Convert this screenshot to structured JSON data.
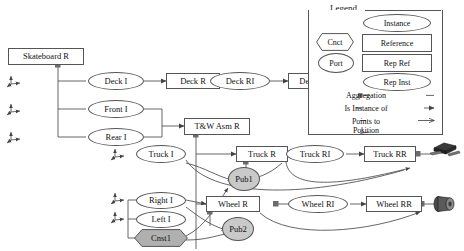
{
  "diagram": {
    "nodes": [
      {
        "id": "skateboard-r",
        "label": "Skateboard R",
        "shape": "rect",
        "x": 8,
        "y": 48,
        "w": 76,
        "h": 17
      },
      {
        "id": "deck-i",
        "label": "Deck I",
        "shape": "ellipse",
        "x": 88,
        "y": 72,
        "w": 56,
        "h": 18
      },
      {
        "id": "front-i",
        "label": "Front I",
        "shape": "ellipse",
        "x": 88,
        "y": 100,
        "w": 56,
        "h": 18
      },
      {
        "id": "rear-i",
        "label": "Rear I",
        "shape": "ellipse",
        "x": 88,
        "y": 128,
        "w": 56,
        "h": 18
      },
      {
        "id": "deck-r",
        "label": "Deck R",
        "shape": "rect",
        "x": 88,
        "y": 73,
        "w": 54,
        "h": 16
      },
      {
        "id": "deck-ri",
        "label": "Deck RI",
        "shape": "ellipse",
        "x": 150,
        "y": 72,
        "w": 60,
        "h": 18
      },
      {
        "id": "deck-rr",
        "label": "Deck RR",
        "shape": "rect",
        "x": 216,
        "y": 73,
        "w": 54,
        "h": 16
      },
      {
        "id": "tw-asm-r",
        "label": "T&W Asm R",
        "shape": "rect",
        "x": 86,
        "y": 118,
        "w": 66,
        "h": 17
      },
      {
        "id": "truck-i",
        "label": "Truck I",
        "shape": "ellipse",
        "x": 103,
        "y": 145,
        "w": 50,
        "h": 18
      },
      {
        "id": "truck-r",
        "label": "Truck R",
        "shape": "rect",
        "x": 168,
        "y": 146,
        "w": 52,
        "h": 16
      },
      {
        "id": "truck-ri",
        "label": "Truck RI",
        "shape": "ellipse",
        "x": 226,
        "y": 145,
        "w": 58,
        "h": 18
      },
      {
        "id": "truck-rr",
        "label": "Truck RR",
        "shape": "rect",
        "x": 294,
        "y": 146,
        "w": 52,
        "h": 16
      },
      {
        "id": "pub1",
        "label": "Pub1",
        "shape": "circle",
        "x": 185,
        "y": 168,
        "w": 32,
        "h": 24
      },
      {
        "id": "right-i",
        "label": "Right I",
        "shape": "ellipse",
        "x": 103,
        "y": 191,
        "w": 50,
        "h": 17
      },
      {
        "id": "left-i",
        "label": "Left I",
        "shape": "ellipse",
        "x": 103,
        "y": 210,
        "w": 50,
        "h": 17
      },
      {
        "id": "cnst1",
        "label": "Cnst1",
        "shape": "hexagon",
        "x": 101,
        "y": 229,
        "w": 54,
        "h": 18
      },
      {
        "id": "wheel-r",
        "label": "Wheel R",
        "shape": "rect",
        "x": 168,
        "y": 196,
        "w": 54,
        "h": 16
      },
      {
        "id": "wheel-ri",
        "label": "Wheel RI",
        "shape": "ellipse",
        "x": 226,
        "y": 195,
        "w": 60,
        "h": 18
      },
      {
        "id": "wheel-rr",
        "label": "Wheel RR",
        "shape": "rect",
        "x": 292,
        "y": 196,
        "w": 56,
        "h": 16
      },
      {
        "id": "pub2",
        "label": "Pub2",
        "shape": "circle",
        "x": 185,
        "y": 217,
        "w": 32,
        "h": 24
      }
    ],
    "models": [
      {
        "id": "deck-model",
        "name": "deck-3d-model",
        "x": 263,
        "y": 74
      },
      {
        "id": "truck-model",
        "name": "truck-3d-model",
        "x": 345,
        "y": 145
      },
      {
        "id": "wheel-model",
        "name": "wheel-3d-model",
        "x": 348,
        "y": 196
      }
    ],
    "axes": [
      {
        "id": "axis-deck",
        "x": 6,
        "y": 76
      },
      {
        "id": "axis-front",
        "x": 6,
        "y": 104
      },
      {
        "id": "axis-rear",
        "x": 6,
        "y": 132
      },
      {
        "id": "axis-truck",
        "x": 78,
        "y": 148
      },
      {
        "id": "axis-right",
        "x": 78,
        "y": 192
      },
      {
        "id": "axis-left",
        "x": 78,
        "y": 211
      }
    ]
  },
  "legend": {
    "title": "Legend",
    "box": {
      "x": 308,
      "y": 8,
      "w": 133,
      "h": 126
    },
    "shapes": [
      {
        "id": "legend-instance",
        "label": "Instance",
        "shape": "ellipse",
        "x": 363,
        "y": 14,
        "w": 66,
        "h": 16
      },
      {
        "id": "legend-cnct",
        "label": "Cnct",
        "shape": "hexagon",
        "x": 316,
        "y": 33,
        "w": 38,
        "h": 18
      },
      {
        "id": "legend-reference",
        "label": "Reference",
        "shape": "rect",
        "x": 362,
        "y": 34,
        "w": 68,
        "h": 16
      },
      {
        "id": "legend-port",
        "label": "Port",
        "shape": "ellipse",
        "x": 318,
        "y": 53,
        "w": 34,
        "h": 18
      },
      {
        "id": "legend-rep-ref",
        "label": "Rep Ref",
        "shape": "rect",
        "x": 362,
        "y": 54,
        "w": 68,
        "h": 16
      },
      {
        "id": "legend-rep-inst",
        "label": "Rep Inst",
        "shape": "ellipse",
        "x": 363,
        "y": 73,
        "w": 66,
        "h": 16
      }
    ],
    "relations": [
      {
        "id": "legend-aggregation",
        "label": "Aggregation",
        "y": 93
      },
      {
        "id": "legend-is-instance-of",
        "label": "Is Instance of",
        "y": 107
      },
      {
        "id": "legend-points-to",
        "label": "Points to",
        "y": 120
      },
      {
        "id": "legend-position",
        "label": "Position",
        "y": 132
      }
    ]
  },
  "colors": {
    "stroke": "#555555",
    "fill": "#ffffff",
    "pub_fill": "#c9c9c9",
    "cnst_fill": "#b0b0b0",
    "model_dark": "#2b2b2b",
    "text": "#111111"
  }
}
